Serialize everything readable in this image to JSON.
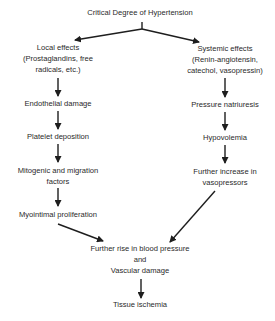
{
  "diagram": {
    "title": "Critical Degree of Hypertension",
    "top_fragment": "",
    "left_branch": {
      "header": [
        "Local effects",
        "(Prostaglandins, free",
        "radicals, etc.)"
      ],
      "steps": [
        [
          "Endothelial damage"
        ],
        [
          "Platelet deposition"
        ],
        [
          "Mitogenic and migration",
          "factors"
        ],
        [
          "Myointimal proliferation"
        ]
      ]
    },
    "right_branch": {
      "header": [
        "Systemic effects",
        "(Renin-angiotensin,",
        "catechol, vasopressin)"
      ],
      "steps": [
        [
          "Pressure natriuresis"
        ],
        [
          "Hypovolemia"
        ],
        [
          "Further increase in",
          "vasopressors"
        ]
      ]
    },
    "convergence": [
      "Further rise in blood pressure",
      "and",
      "Vascular damage"
    ],
    "outcome": "Tissue ischemia",
    "colors": {
      "ink": "#2a2a2a",
      "background": "#ffffff"
    }
  }
}
